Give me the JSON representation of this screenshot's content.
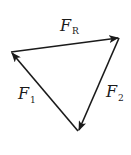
{
  "diagram": {
    "stroke_color": "#1a1a1a",
    "background": "#ffffff",
    "vertices": {
      "left": [
        11,
        52
      ],
      "top_right": [
        119,
        38
      ],
      "bottom": [
        78,
        131
      ]
    },
    "vectors": [
      {
        "id": "FR",
        "name": "F",
        "subscript": "R",
        "from": "left",
        "to": "top_right"
      },
      {
        "id": "F2",
        "name": "F",
        "subscript": "2",
        "from": "top_right",
        "to": "bottom"
      },
      {
        "id": "F1",
        "name": "F",
        "subscript": "1",
        "from": "bottom",
        "to": "left"
      }
    ],
    "labels": {
      "fr_main": "F",
      "fr_sub": "R",
      "f1_main": "F",
      "f1_sub": "1",
      "f2_main": "F",
      "f2_sub": "2"
    }
  }
}
